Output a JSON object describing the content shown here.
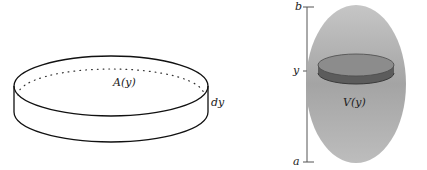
{
  "left_figure": {
    "name": "cylindrical-slice",
    "area_label": "A(y)",
    "thickness_label": "dy"
  },
  "right_figure": {
    "name": "solid-with-slice",
    "axis_labels": {
      "top": "b",
      "middle": "y",
      "bottom": "a"
    },
    "volume_label": "V(y)",
    "colors": {
      "solid_fill": "#a8a8a8",
      "slice_top": "#8a8a8a",
      "slice_band": "#5a5a5a"
    }
  }
}
